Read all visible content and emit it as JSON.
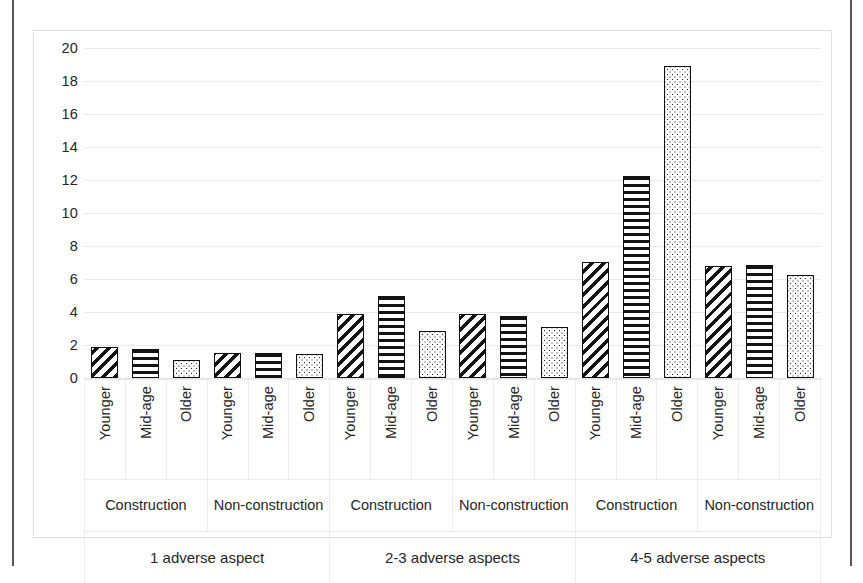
{
  "chart_data": {
    "type": "bar",
    "title": "",
    "subtitle": "",
    "xlabel": "",
    "ylabel": "",
    "ylim": [
      0,
      20
    ],
    "y_ticks": [
      20,
      18,
      16,
      14,
      12,
      10,
      8,
      6,
      4,
      2,
      0
    ],
    "grid": true,
    "legend_position": "none",
    "series_names": [
      "Younger",
      "Mid-age",
      "Older"
    ],
    "series_patterns": [
      "diagonal-hatch",
      "horizontal-hatch",
      "dotted"
    ],
    "group_levels": {
      "aspect": [
        "1 adverse aspect",
        "2-3 adverse aspects",
        "4-5 adverse aspects"
      ],
      "industry": [
        "Construction",
        "Non-construction"
      ],
      "age": [
        "Younger",
        "Mid-age",
        "Older"
      ]
    },
    "categories": [
      "1 adverse aspect / Construction / Younger",
      "1 adverse aspect / Construction / Mid-age",
      "1 adverse aspect / Construction / Older",
      "1 adverse aspect / Non-construction / Younger",
      "1 adverse aspect / Non-construction / Mid-age",
      "1 adverse aspect / Non-construction / Older",
      "2-3 adverse aspects / Construction / Younger",
      "2-3 adverse aspects / Construction / Mid-age",
      "2-3 adverse aspects / Construction / Older",
      "2-3 adverse aspects / Non-construction / Younger",
      "2-3 adverse aspects / Non-construction / Mid-age",
      "2-3 adverse aspects / Non-construction / Older",
      "4-5 adverse aspects / Construction / Younger",
      "4-5 adverse aspects / Construction / Mid-age",
      "4-5 adverse aspects / Construction / Older",
      "4-5 adverse aspects / Non-construction / Younger",
      "4-5 adverse aspects / Non-construction / Mid-age",
      "4-5 adverse aspects / Non-construction / Older"
    ],
    "values": [
      1.9,
      1.75,
      1.1,
      1.5,
      1.5,
      1.45,
      3.85,
      5.0,
      2.85,
      3.85,
      3.75,
      3.1,
      7.05,
      12.25,
      18.9,
      6.8,
      6.85,
      6.25
    ],
    "groups": [
      {
        "aspect": "1 adverse aspect",
        "industries": [
          {
            "industry": "Construction",
            "bars": [
              {
                "age": "Younger",
                "value": 1.9,
                "pattern": "diagonal-hatch"
              },
              {
                "age": "Mid-age",
                "value": 1.75,
                "pattern": "horizontal-hatch"
              },
              {
                "age": "Older",
                "value": 1.1,
                "pattern": "dotted"
              }
            ]
          },
          {
            "industry": "Non-construction",
            "bars": [
              {
                "age": "Younger",
                "value": 1.5,
                "pattern": "diagonal-hatch"
              },
              {
                "age": "Mid-age",
                "value": 1.5,
                "pattern": "horizontal-hatch"
              },
              {
                "age": "Older",
                "value": 1.45,
                "pattern": "dotted"
              }
            ]
          }
        ]
      },
      {
        "aspect": "2-3 adverse aspects",
        "industries": [
          {
            "industry": "Construction",
            "bars": [
              {
                "age": "Younger",
                "value": 3.85,
                "pattern": "diagonal-hatch"
              },
              {
                "age": "Mid-age",
                "value": 5.0,
                "pattern": "horizontal-hatch"
              },
              {
                "age": "Older",
                "value": 2.85,
                "pattern": "dotted"
              }
            ]
          },
          {
            "industry": "Non-construction",
            "bars": [
              {
                "age": "Younger",
                "value": 3.85,
                "pattern": "diagonal-hatch"
              },
              {
                "age": "Mid-age",
                "value": 3.75,
                "pattern": "horizontal-hatch"
              },
              {
                "age": "Older",
                "value": 3.1,
                "pattern": "dotted"
              }
            ]
          }
        ]
      },
      {
        "aspect": "4-5 adverse aspects",
        "industries": [
          {
            "industry": "Construction",
            "bars": [
              {
                "age": "Younger",
                "value": 7.05,
                "pattern": "diagonal-hatch"
              },
              {
                "age": "Mid-age",
                "value": 12.25,
                "pattern": "horizontal-hatch"
              },
              {
                "age": "Older",
                "value": 18.9,
                "pattern": "dotted"
              }
            ]
          },
          {
            "industry": "Non-construction",
            "bars": [
              {
                "age": "Younger",
                "value": 6.8,
                "pattern": "diagonal-hatch"
              },
              {
                "age": "Mid-age",
                "value": 6.85,
                "pattern": "horizontal-hatch"
              },
              {
                "age": "Older",
                "value": 6.25,
                "pattern": "dotted"
              }
            ]
          }
        ]
      }
    ]
  },
  "colors": {
    "bar_outline": "#111111",
    "hatch": "#141414",
    "gridline": "#e9e9e9",
    "frame": "#dfdfdf",
    "text": "#262626",
    "page_edge": "#3a3a3a"
  }
}
